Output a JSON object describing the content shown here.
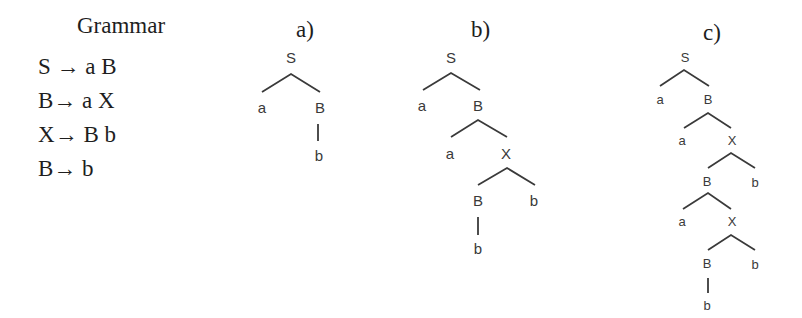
{
  "grammar": {
    "title": "Grammar",
    "rules": [
      {
        "lhs": "S",
        "arrow": "→",
        "rhs": "a B"
      },
      {
        "lhs": "B",
        "arrow": "→",
        "rhs": "a X"
      },
      {
        "lhs": "X",
        "arrow": "→",
        "rhs": "B b"
      },
      {
        "lhs": "B",
        "arrow": "→",
        "rhs": "b"
      }
    ]
  },
  "trees": {
    "a": {
      "label": "a)",
      "nodes": {
        "n0": "S",
        "n1": "a",
        "n2": "B",
        "n3": "b"
      }
    },
    "b": {
      "label": "b)",
      "nodes": {
        "n0": "S",
        "n1": "a",
        "n2": "B",
        "n3": "a",
        "n4": "X",
        "n5": "B",
        "n6": "b",
        "n7": "b"
      }
    },
    "c": {
      "label": "c)",
      "nodes": {
        "n0": "S",
        "n1": "a",
        "n2": "B",
        "n3": "a",
        "n4": "X",
        "n5": "B",
        "n6": "b",
        "n7": "a",
        "n8": "X",
        "n9": "B",
        "n10": "b",
        "n11": "b"
      }
    }
  },
  "colors": {
    "text": "#1e1e1e",
    "tree": "#3a3a3a",
    "background": "#ffffff"
  }
}
